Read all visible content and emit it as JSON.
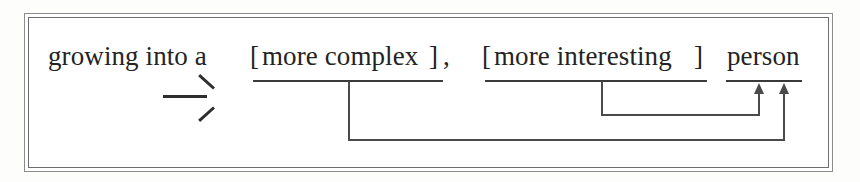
{
  "figure": {
    "type": "syntactic-movement-diagram",
    "frame_style": "double-ruled-box",
    "background_color": "#ffffff",
    "ink_color": "#232323",
    "line_color": "#4a4a4a"
  },
  "sentence": {
    "full_text": "growing into a [more complex], [more interesting] person",
    "tokens": {
      "lead_in": "growing into a",
      "bracket_open_1": "[",
      "constituent_1": "more complex",
      "bracket_close_1": "]",
      "comma_1": ",",
      "bracket_open_2": "[",
      "constituent_2": "more interesting",
      "bracket_close_2": "]",
      "head_noun": "person"
    }
  },
  "derivation": {
    "arrow_glyph": "rightwards-arrow",
    "arrow_meaning": "derives-to"
  },
  "movement": {
    "targets": [
      {
        "source": "more complex",
        "destination": "person",
        "arrowhead": "up",
        "path": "down-right-up",
        "outer": true
      },
      {
        "source": "more interesting",
        "destination": "person",
        "arrowhead": "up",
        "path": "down-right-up",
        "outer": false
      }
    ],
    "arrowhead_count": 2
  },
  "underlines": {
    "constituent_1_label": "more complex",
    "constituent_2_label": "more interesting",
    "head_label": "person"
  }
}
